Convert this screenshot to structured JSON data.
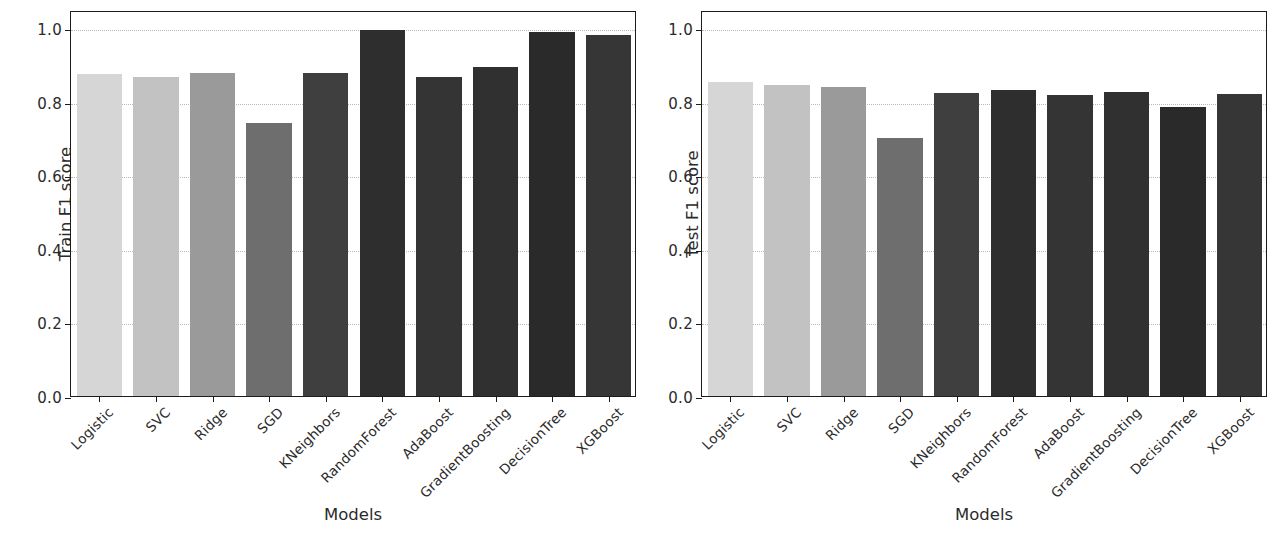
{
  "figure": {
    "background": "#ffffff",
    "panel_count": 2
  },
  "chart_data": [
    {
      "type": "bar",
      "panel": "left",
      "title": "",
      "xlabel": "Models",
      "ylabel": "Train F1 score",
      "ylim": [
        0.0,
        1.05
      ],
      "yticks": [
        "0.0",
        "0.2",
        "0.4",
        "0.6",
        "0.8",
        "1.0"
      ],
      "ytick_values": [
        0.0,
        0.2,
        0.4,
        0.6,
        0.8,
        1.0
      ],
      "grid": "horizontal-dotted",
      "legend": "none",
      "categories": [
        "Logistic",
        "SVC",
        "Ridge",
        "SGD",
        "KNeighbors",
        "RandomForest",
        "AdaBoost",
        "GradientBoosting",
        "DecisionTree",
        "XGBoost"
      ],
      "values": [
        0.875,
        0.868,
        0.878,
        0.743,
        0.878,
        0.995,
        0.868,
        0.895,
        0.99,
        0.982
      ],
      "colors": [
        "#d6d6d6",
        "#c2c2c2",
        "#9a9a9a",
        "#6e6e6e",
        "#3f3f3f",
        "#2e2e2e",
        "#343434",
        "#303030",
        "#2a2a2a",
        "#363636"
      ]
    },
    {
      "type": "bar",
      "panel": "right",
      "title": "",
      "xlabel": "Models",
      "ylabel": "Test F1 score",
      "ylim": [
        0.0,
        1.05
      ],
      "yticks": [
        "0.0",
        "0.2",
        "0.4",
        "0.6",
        "0.8",
        "1.0"
      ],
      "ytick_values": [
        0.0,
        0.2,
        0.4,
        0.6,
        0.8,
        1.0
      ],
      "grid": "horizontal-dotted",
      "legend": "none",
      "categories": [
        "Logistic",
        "SVC",
        "Ridge",
        "SGD",
        "KNeighbors",
        "RandomForest",
        "AdaBoost",
        "GradientBoosting",
        "DecisionTree",
        "XGBoost"
      ],
      "values": [
        0.853,
        0.847,
        0.84,
        0.703,
        0.825,
        0.832,
        0.82,
        0.827,
        0.787,
        0.822
      ],
      "colors": [
        "#d6d6d6",
        "#c2c2c2",
        "#9a9a9a",
        "#6e6e6e",
        "#3f3f3f",
        "#2e2e2e",
        "#343434",
        "#303030",
        "#2a2a2a",
        "#363636"
      ]
    }
  ]
}
